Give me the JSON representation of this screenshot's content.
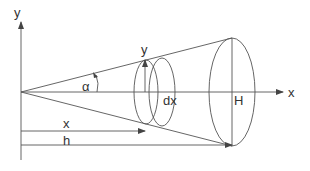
{
  "diagram": {
    "type": "cone-volume-integration",
    "colors": {
      "stroke": "#555555",
      "background": "#ffffff",
      "text": "#333333"
    },
    "labels": {
      "y_axis": "y",
      "x_axis": "x",
      "angle": "α",
      "slice_radius": "y",
      "slice_thickness": "dx",
      "base_radius": "H",
      "distance_x": "x",
      "height": "h"
    }
  }
}
